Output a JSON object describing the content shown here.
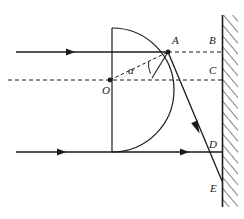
{
  "figure": {
    "background_color": "#ffffff",
    "stroke_color": "#1a1a1a",
    "width": 244,
    "height": 219
  },
  "labels": {
    "A": "A",
    "B": "B",
    "C": "C",
    "D": "D",
    "E": "E",
    "O": "O",
    "alpha": "α"
  },
  "elements": {
    "wall": {
      "name": "hatched-wall",
      "x": 222,
      "y_top": 15,
      "y_bottom": 207,
      "hatch_direction": "up-right"
    },
    "lens": {
      "name": "semicircular-lens",
      "flat_side_x": 112,
      "center_x": 112,
      "center_y": 80,
      "top_y": 28,
      "bottom_y": 152,
      "radius": 58
    },
    "point_O": {
      "x": 110,
      "y": 80
    },
    "point_A": {
      "x": 168,
      "y": 52
    },
    "point_D": {
      "x": 222,
      "y": 152
    },
    "point_E": {
      "x": 222,
      "y": 181
    }
  },
  "rays": {
    "upper_incident": {
      "name": "upper-incident-ray",
      "y": 52,
      "x_start": 16,
      "x_end": 168,
      "arrow_x": 72
    },
    "lower_incident": {
      "name": "lower-incident-ray",
      "y": 152,
      "x_start": 16,
      "x_end": 222,
      "arrow_x_1": 63,
      "arrow_x_2": 186
    },
    "refracted": {
      "name": "refracted-ray",
      "from_x": 168,
      "from_y": 52,
      "to_x": 222,
      "to_y": 181,
      "arrow_x": 198,
      "arrow_y": 130
    },
    "axis_dashed": {
      "name": "optical-axis-dashed",
      "y": 80,
      "x_start": 8,
      "x_end": 222
    },
    "upper_dashed": {
      "name": "upper-extension-dashed",
      "y": 52,
      "x_start": 168,
      "x_end": 222
    },
    "normal_dashed": {
      "name": "normal-radius-dashed",
      "from_x": 110,
      "from_y": 80,
      "to_x": 168,
      "to_y": 52
    }
  }
}
